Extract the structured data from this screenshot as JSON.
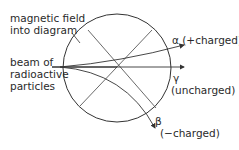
{
  "labels": {
    "field_line1": "magnetic field",
    "field_line2": "into diagram",
    "beam_line1": "beam of",
    "beam_line2": "radioactive",
    "beam_line3": "particles",
    "alpha": "α (+charged)",
    "gamma_symbol": "γ",
    "gamma_desc": "(uncharged)",
    "beta_symbol": "β",
    "beta_desc": "(−charged)"
  },
  "colors": {
    "line": "#333333",
    "background": "#ffffff"
  }
}
